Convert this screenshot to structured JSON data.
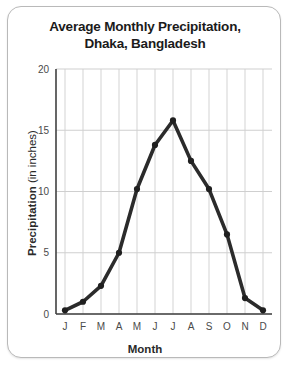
{
  "card": {
    "accent_color": "#2b2b2b",
    "border_color": "#b9b9b9"
  },
  "chart_data": {
    "type": "line",
    "title": "Average Monthly Precipitation,",
    "title_line2": "Dhaka, Bangladesh",
    "xlabel": "Month",
    "ylabel_bold": "Precipitation",
    "ylabel_light": "(in inches)",
    "categories": [
      "J",
      "F",
      "M",
      "A",
      "M",
      "J",
      "J",
      "A",
      "S",
      "O",
      "N",
      "D"
    ],
    "values": [
      0.3,
      1.0,
      2.3,
      5.0,
      10.2,
      13.8,
      15.8,
      12.5,
      10.2,
      6.5,
      1.3,
      0.3
    ],
    "yticks": [
      0,
      5,
      10,
      15,
      20
    ],
    "ylim": [
      0,
      20
    ],
    "grid": true,
    "legend": "none",
    "series_name": "Average Monthly Precipitation"
  }
}
